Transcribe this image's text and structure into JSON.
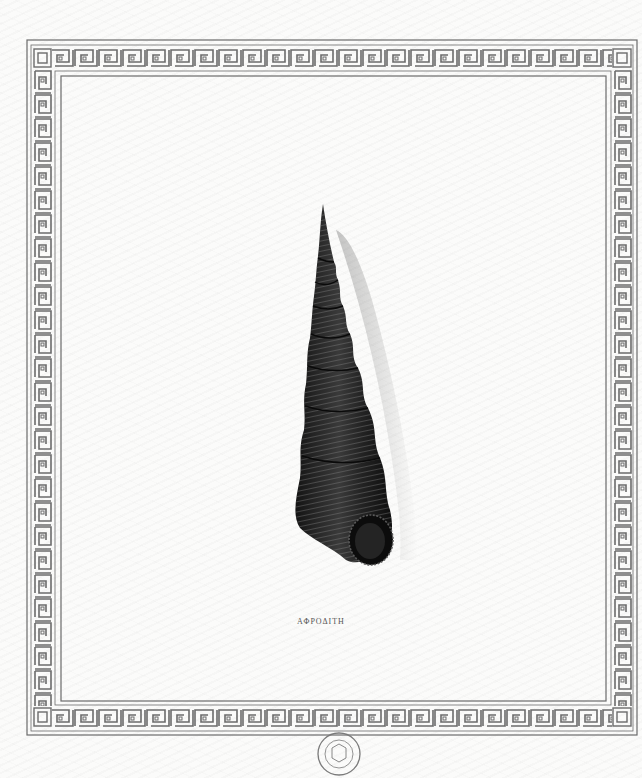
{
  "plate": {
    "caption": "ΑΦΡΟΔΙΤΗ",
    "subject": "terebra-shell-illustration",
    "border_style": "greek-key-meander"
  },
  "stamp": {
    "top_text": "BRITISH MUSEUM",
    "bottom_text": "NATURAL HISTORY",
    "left_letter": "Z",
    "right_letter": "D"
  },
  "colors": {
    "paper": "#fbfbfa",
    "border_ink": "#6b6b6b",
    "shell_dark": "#1a1a1a",
    "shell_highlight": "#6a6a6a"
  }
}
